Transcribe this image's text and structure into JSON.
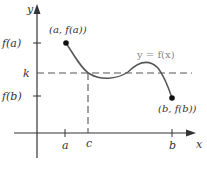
{
  "diagram": {
    "axes": {
      "x_label": "x",
      "y_label": "y"
    },
    "y_ticks": [
      {
        "label": "f(a)"
      },
      {
        "label": "k"
      },
      {
        "label": "f(b)"
      }
    ],
    "x_ticks": [
      {
        "label": "a"
      },
      {
        "label": "c"
      },
      {
        "label": "b"
      }
    ],
    "points": [
      {
        "label": "(a, f(a))"
      },
      {
        "label": "(b, f(b))"
      }
    ],
    "curve_label": "y = f(x)",
    "colors": {
      "axis": "#333333",
      "curve": "#555555",
      "dashed": "#555555",
      "curve_label": "#888888"
    }
  }
}
